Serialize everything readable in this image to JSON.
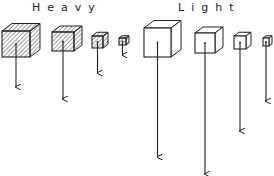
{
  "diagram": {
    "groups": [
      {
        "label": "Heavy",
        "fill": "hatched",
        "cubes": [
          {
            "size": "large",
            "x": 2,
            "y": 31,
            "w": 28,
            "h": 26,
            "depth": 10,
            "arrow_end_y": 88
          },
          {
            "size": "medium",
            "x": 52,
            "y": 32,
            "w": 22,
            "h": 19,
            "depth": 8,
            "arrow_end_y": 100
          },
          {
            "size": "small",
            "x": 92,
            "y": 36,
            "w": 11,
            "h": 12,
            "depth": 5,
            "arrow_end_y": 74
          },
          {
            "size": "tiny",
            "x": 119,
            "y": 38,
            "w": 7,
            "h": 7,
            "depth": 3,
            "arrow_end_y": 56
          }
        ]
      },
      {
        "label": "Light",
        "fill": "none",
        "cubes": [
          {
            "size": "large",
            "x": 144,
            "y": 28,
            "w": 27,
            "h": 29,
            "depth": 10,
            "arrow_end_y": 158
          },
          {
            "size": "medium",
            "x": 195,
            "y": 33,
            "w": 20,
            "h": 20,
            "depth": 8,
            "arrow_end_y": 175
          },
          {
            "size": "small",
            "x": 234,
            "y": 36,
            "w": 12,
            "h": 13,
            "depth": 5,
            "arrow_end_y": 132
          },
          {
            "size": "tiny",
            "x": 263,
            "y": 38,
            "w": 6,
            "h": 8,
            "depth": 3,
            "arrow_end_y": 102
          }
        ]
      }
    ],
    "colors": {
      "stroke": "#222222",
      "background": "#ffffff"
    }
  }
}
